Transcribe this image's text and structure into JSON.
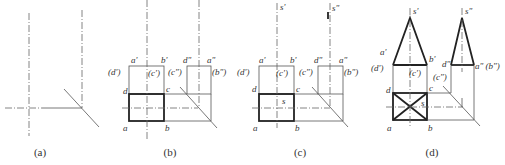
{
  "figures": [
    {
      "id": "a",
      "caption": "(a)",
      "labels": []
    },
    {
      "id": "b",
      "caption": "(b)",
      "labels": {
        "a_prime": "a'",
        "b_prime": "b'",
        "d_prime": "(d')",
        "c_prime": "(c')",
        "d_dprime": "d\"",
        "a_dprime": "a\"",
        "c_dprime": "(c\")",
        "b_dprime": "(b\")",
        "d": "d",
        "c": "c",
        "a": "a",
        "b": "b"
      }
    },
    {
      "id": "c",
      "caption": "(c)",
      "labels": {
        "s_prime": "s'",
        "s_dprime": "s\"",
        "a_prime": "a'",
        "b_prime": "b'",
        "d_prime": "(d')",
        "c_prime": "(c')",
        "d_dprime": "d\"",
        "a_dprime": "a\"",
        "c_dprime": "(c\")",
        "b_dprime": "(b\")",
        "d": "d",
        "c": "c",
        "s": "s",
        "a": "a",
        "b": "b"
      }
    },
    {
      "id": "d",
      "caption": "(d)",
      "labels": {
        "s_prime": "s'",
        "s_dprime": "s\"",
        "a_prime": "a'",
        "b_prime": "b'",
        "d_prime": "(d')",
        "c_prime": "(c')",
        "d_dprime": "d\"",
        "a_b_dprime": "a\" (b\")",
        "c_dprime": "(c\")",
        "d": "d",
        "c": "c",
        "s": "s",
        "a": "a",
        "b": "b"
      }
    }
  ]
}
